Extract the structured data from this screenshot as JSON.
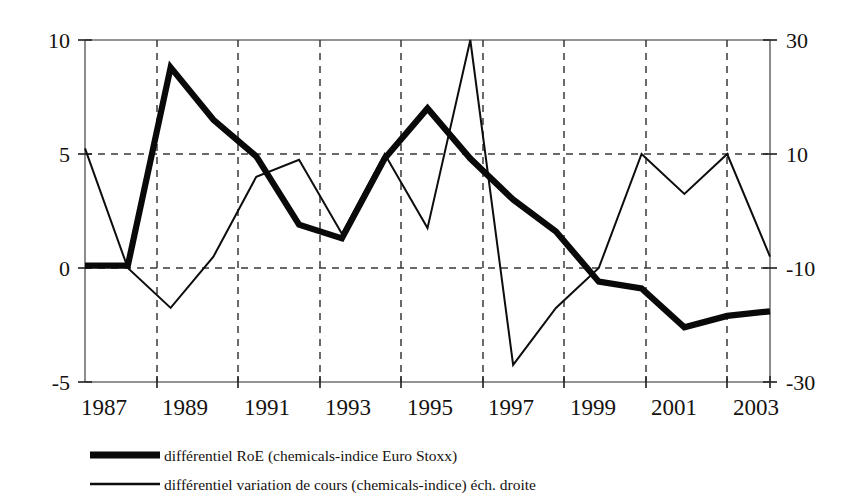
{
  "chart_data": {
    "type": "line",
    "title": "",
    "subtitle": "",
    "xlabel": "",
    "ylabel": "",
    "grid": true,
    "legend_position": "bottom",
    "x": [
      1987,
      1988,
      1989,
      1990,
      1991,
      1992,
      1993,
      1994,
      1995,
      1996,
      1997,
      1998,
      1999,
      2000,
      2001,
      2002,
      2003
    ],
    "x_tick_labels": [
      "1987",
      "1989",
      "1991",
      "1993",
      "1995",
      "1997",
      "1999",
      "2001",
      "2003"
    ],
    "x_tick_values": [
      1987,
      1989,
      1991,
      1993,
      1995,
      1997,
      1999,
      2001,
      2003
    ],
    "xlim": [
      1987,
      2003
    ],
    "left_axis": {
      "label": "",
      "ylim": [
        -5,
        10
      ],
      "ticks": [
        10,
        5,
        0,
        -5
      ],
      "tick_labels": [
        "10",
        "5",
        "0",
        "-5"
      ]
    },
    "right_axis": {
      "label": "",
      "ylim": [
        -30,
        30
      ],
      "ticks": [
        30,
        10,
        -10,
        -30
      ],
      "tick_labels": [
        "30",
        "10",
        "-10",
        "-30"
      ]
    },
    "series": [
      {
        "name": "différentiel RoE (chemicals-indice Euro Stoxx)",
        "axis": "left",
        "style": "thick",
        "color": "#090909",
        "values": [
          0.1,
          0.1,
          8.8,
          6.5,
          4.9,
          1.9,
          1.3,
          4.8,
          7.0,
          4.8,
          3.0,
          1.6,
          -0.6,
          -0.9,
          -2.6,
          -2.1,
          -1.9
        ]
      },
      {
        "name": "différentiel variation de cours (chemicals-indice) éch. droite",
        "axis": "right",
        "style": "thin",
        "color": "#0d0d0d",
        "values": [
          11.0,
          -10.0,
          -17.0,
          -8.0,
          6.0,
          9.0,
          -4.0,
          10.0,
          -3.0,
          30.0,
          -27.0,
          -17.0,
          -10.0,
          10.0,
          3.0,
          10.0,
          -8.0
        ]
      }
    ]
  },
  "legend": {
    "items": [
      {
        "label": "différentiel RoE (chemicals-indice Euro Stoxx)",
        "style": "thick"
      },
      {
        "label": "différentiel variation de cours (chemicals-indice) éch. droite",
        "style": "thin"
      }
    ]
  },
  "axes": {
    "left_tick_labels": [
      "10",
      "5",
      "0",
      "-5"
    ],
    "right_tick_labels": [
      "30",
      "10",
      "-10",
      "-30"
    ],
    "x_tick_labels": [
      "1987",
      "1989",
      "1991",
      "1993",
      "1995",
      "1997",
      "1999",
      "2001",
      "2003"
    ]
  }
}
